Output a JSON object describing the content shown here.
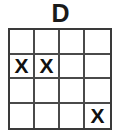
{
  "figure": {
    "title": "D",
    "grid": {
      "rows": 4,
      "columns": 4,
      "mark_symbol": "X",
      "border_color": "#3a3a3a",
      "line_color": "#4a4a4a",
      "cell_background": "#ffffff",
      "mark_color": "#111111",
      "cells": [
        [
          {
            "mark": ""
          },
          {
            "mark": ""
          },
          {
            "mark": ""
          },
          {
            "mark": ""
          }
        ],
        [
          {
            "mark": "X"
          },
          {
            "mark": "X"
          },
          {
            "mark": ""
          },
          {
            "mark": ""
          }
        ],
        [
          {
            "mark": ""
          },
          {
            "mark": ""
          },
          {
            "mark": ""
          },
          {
            "mark": ""
          }
        ],
        [
          {
            "mark": ""
          },
          {
            "mark": ""
          },
          {
            "mark": ""
          },
          {
            "mark": "X"
          }
        ]
      ]
    }
  }
}
